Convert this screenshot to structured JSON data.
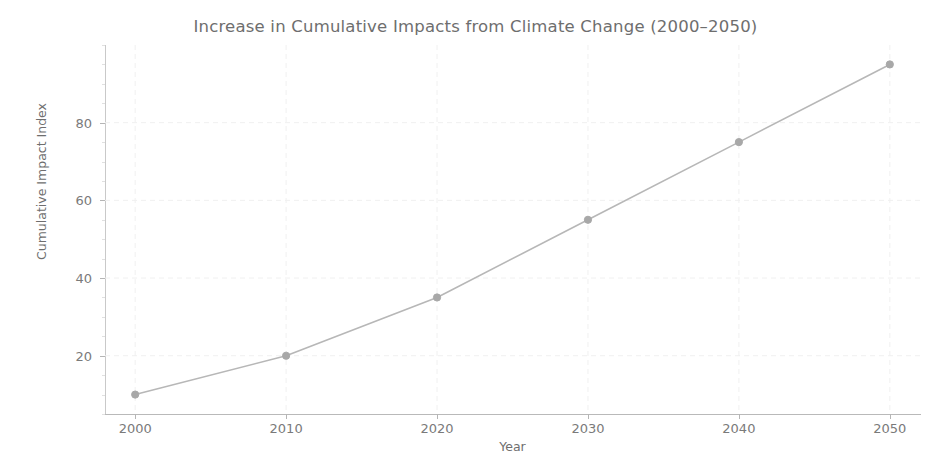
{
  "chart_data": {
    "type": "line",
    "title": "Increase in Cumulative Impacts from Climate Change (2000–2050)",
    "xlabel": "Year",
    "ylabel": "Cumulative Impact Index",
    "x": [
      2000,
      2010,
      2020,
      2030,
      2040,
      2050
    ],
    "categories": [
      "2000",
      "2010",
      "2020",
      "2030",
      "2040",
      "2050"
    ],
    "values": [
      10,
      20,
      35,
      55,
      75,
      95
    ],
    "series": [
      {
        "name": "Cumulative Impact Index",
        "values": [
          10,
          20,
          35,
          55,
          75,
          95
        ],
        "line_color": "#b7b7b7",
        "marker": "circle",
        "marker_color": "#a8a8a8"
      }
    ],
    "xlim": [
      1998,
      2052
    ],
    "ylim": [
      5,
      100
    ],
    "xticks": [
      2000,
      2010,
      2020,
      2030,
      2040,
      2050
    ],
    "xtick_labels": [
      "2000",
      "2010",
      "2020",
      "2030",
      "2040",
      "2050"
    ],
    "yticks": [
      20,
      40,
      60,
      80
    ],
    "ytick_labels": [
      "20",
      "40",
      "60",
      "80"
    ],
    "grid": true,
    "grid_style": "dashed",
    "grid_color": "#f0f0f0",
    "legend": false,
    "legend_position": "none",
    "background_color": "#ffffff",
    "title_color": "#6e6e6e",
    "axis_color": "#b9b9b9",
    "tick_label_color": "#7a7a7a"
  }
}
